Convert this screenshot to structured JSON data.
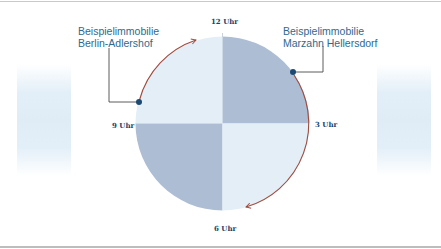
{
  "colors": {
    "light_quadrant": "#e4eef7",
    "dark_quadrant": "#adbdd4",
    "arrow": "#a04a3a",
    "dot": "#1d4a73",
    "leader_line": "#4a4a4a",
    "label_text": "#2d6a8f",
    "clock_text": "#1d3f66"
  },
  "clock_labels": {
    "twelve": "12 Uhr",
    "three": "3 Uhr",
    "six": "6 Uhr",
    "nine": "9 Uhr"
  },
  "callouts": [
    {
      "line1": "Beispielimmobilie",
      "line2": "Berlin-Adlershof",
      "position": "near 10 o'clock"
    },
    {
      "line1": "Beispielimmobilie",
      "line2": "Marzahn Hellersdorf",
      "position": "near 1-2 o'clock"
    }
  ],
  "quadrants": [
    {
      "name": "top-left",
      "shade": "light"
    },
    {
      "name": "top-right",
      "shade": "dark"
    },
    {
      "name": "bottom-left",
      "shade": "dark"
    },
    {
      "name": "bottom-right",
      "shade": "light"
    }
  ],
  "arrows": [
    {
      "from": "Berlin-Adlershof dot",
      "to": "12 Uhr",
      "direction": "clockwise"
    },
    {
      "from": "Marzahn Hellersdorf dot",
      "to": "6 Uhr",
      "direction": "clockwise"
    }
  ]
}
